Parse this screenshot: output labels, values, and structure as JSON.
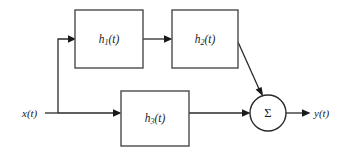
{
  "diagram": {
    "background_color": "#ffffff",
    "line_color": "#2a2a2a",
    "box_stroke_color": "#4b4b4b",
    "input": {
      "label": "x(t)",
      "label_x": 22,
      "label_y": 114
    },
    "output": {
      "label": "y(t)",
      "label_x": 314,
      "label_y": 114
    },
    "blocks": [
      {
        "id": "h1",
        "base": "h",
        "subscript": "1",
        "suffix": "(t)",
        "label": "h1(t)",
        "x": 75,
        "y": 10,
        "width": 68,
        "height": 58
      },
      {
        "id": "h2",
        "base": "h",
        "subscript": "2",
        "suffix": "(t)",
        "label": "h2(t)",
        "x": 172,
        "y": 10,
        "width": 66,
        "height": 58
      },
      {
        "id": "h3",
        "base": "h",
        "subscript": "3",
        "suffix": "(t)",
        "label": "h3(t)",
        "x": 121,
        "y": 91,
        "width": 68,
        "height": 55
      }
    ],
    "summing_junction": {
      "id": "sum",
      "symbol": "Σ",
      "center_x": 268,
      "center_y": 113,
      "radius": 18
    },
    "connections": [
      {
        "id": "input-to-node",
        "from": "x(t)",
        "to": "branch-node",
        "path": "M 45 113 L 58 113"
      },
      {
        "id": "node-to-h1",
        "from": "branch-node",
        "to": "h1",
        "path": "M 58 113 L 58 39 L 70 39"
      },
      {
        "id": "h1-to-h2",
        "from": "h1",
        "to": "h2",
        "path": "M 143 39 L 167 39"
      },
      {
        "id": "h2-to-sum",
        "from": "h2",
        "to": "sum",
        "path": "M 238 42 L 261 94"
      },
      {
        "id": "node-to-h3",
        "from": "branch-node",
        "to": "h3",
        "path": "M 58 113 L 116 113"
      },
      {
        "id": "h3-to-sum",
        "from": "h3",
        "to": "sum",
        "path": "M 189 113 L 245 113"
      },
      {
        "id": "sum-to-output",
        "from": "sum",
        "to": "y(t)",
        "path": "M 286 113 L 305 113"
      }
    ]
  }
}
